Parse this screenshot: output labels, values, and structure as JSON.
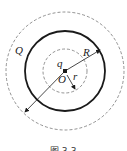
{
  "diagram": {
    "labels": {
      "outer_charge": "Q",
      "inner_charge": "q",
      "center": "O",
      "outer_radius": "R",
      "inner_radius": "r"
    },
    "caption": "图 3-3",
    "colors": {
      "stroke": "#1a1a1a",
      "dashed": "#666666",
      "background": "#ffffff"
    }
  }
}
